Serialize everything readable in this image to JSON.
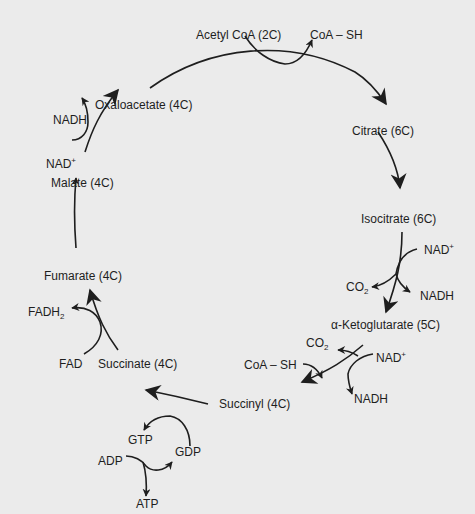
{
  "diagram": {
    "type": "cycle",
    "colors": {
      "background": "#ebebeb",
      "ink": "#1e1e1e"
    },
    "nodes": {
      "acetyl_coa": "Acetyl CoA (2C)",
      "citrate": "Citrate (6C)",
      "isocitrate": "Isocitrate (6C)",
      "alpha_kg": "α-Ketoglutarate (5C)",
      "succinyl": "Succinyl (4C)",
      "succinate": "Succinate (4C)",
      "fumarate": "Fumarate (4C)",
      "malate": "Malate (4C)",
      "oxaloacetate": "Oxaloacetate (4C)"
    },
    "cofactors": {
      "coa_sh_top": "CoA – SH",
      "nad_isocitrate": "NAD",
      "co2_isocitrate": "CO",
      "nadh_isocitrate": "NADH",
      "co2_akg": "CO",
      "nad_akg": "NAD",
      "coa_sh_akg": "CoA – SH",
      "nadh_akg": "NADH",
      "gtp": "GTP",
      "gdp": "GDP",
      "adp": "ADP",
      "atp": "ATP",
      "fad": "FAD",
      "fadh": "FADH",
      "nad_malate": "NAD",
      "nadh_malate": "NADH"
    },
    "sup_plus": "+",
    "sub_2": "2",
    "edges": [
      [
        "Oxaloacetate (4C)",
        "Citrate (6C)"
      ],
      [
        "Citrate (6C)",
        "Isocitrate (6C)"
      ],
      [
        "Isocitrate (6C)",
        "α-Ketoglutarate (5C)"
      ],
      [
        "α-Ketoglutarate (5C)",
        "Succinyl (4C)"
      ],
      [
        "Succinyl (4C)",
        "Succinate (4C)"
      ],
      [
        "Succinate (4C)",
        "Fumarate (4C)"
      ],
      [
        "Fumarate (4C)",
        "Malate (4C)"
      ],
      [
        "Malate (4C)",
        "Oxaloacetate (4C)"
      ]
    ]
  }
}
